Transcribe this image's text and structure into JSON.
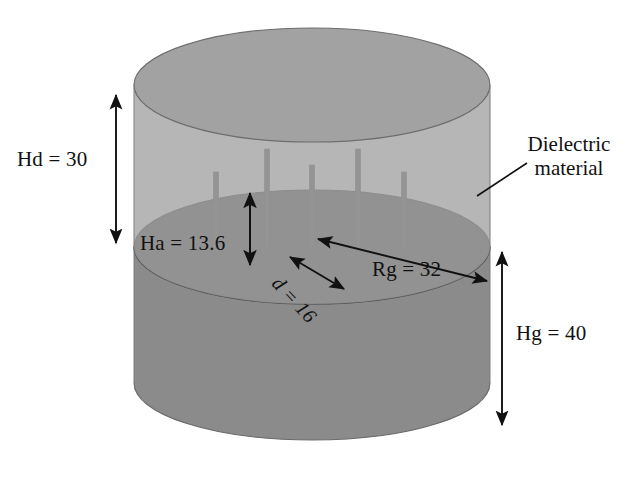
{
  "figure": {
    "background_color": "#ffffff"
  },
  "geometry": {
    "dielectric_cylinder": {
      "fill_color": "#9d9d9d",
      "edge_color": "#6e6e6e",
      "top_ellipse_center_x": 312,
      "top_ellipse_center_y": 85,
      "radius_x": 178,
      "radius_y": 57,
      "top_y": 28,
      "interface_y": 247
    },
    "ground_cylinder": {
      "fill_color": "#8b8b8b",
      "edge_color": "#666666",
      "interface_y": 247,
      "bottom_y": 440
    },
    "ground_plane_ellipse": {
      "fill_color": "#707070",
      "edge_color": "#5a5a5a",
      "center_x": 312,
      "center_y": 247,
      "radius_x": 178,
      "radius_y": 57
    },
    "pins": {
      "count": 5,
      "fill_color": "#7a7a7a",
      "width": 5,
      "items": [
        {
          "x": 216,
          "top_y": 172,
          "bottom_y": 270
        },
        {
          "x": 267,
          "top_y": 149,
          "bottom_y": 288
        },
        {
          "x": 312,
          "top_y": 165,
          "bottom_y": 282
        },
        {
          "x": 358,
          "top_y": 149,
          "bottom_y": 288
        },
        {
          "x": 404,
          "top_y": 172,
          "bottom_y": 270
        }
      ]
    }
  },
  "dimensions": {
    "hd": {
      "label": "Hd = 30",
      "symbol": "Hd",
      "value": 30,
      "arrow_x": 116,
      "arrow_y1": 95,
      "arrow_y2": 243
    },
    "ha": {
      "label": "Ha = 13.6",
      "symbol": "Ha",
      "value": 13.6,
      "arrow_x": 250,
      "arrow_y1": 193,
      "arrow_y2": 265
    },
    "hg": {
      "label": "Hg = 40",
      "symbol": "Hg",
      "value": 40,
      "arrow_x": 502,
      "arrow_y1": 252,
      "arrow_y2": 425
    },
    "rg": {
      "label": "Rg = 32",
      "symbol": "Rg",
      "value": 32,
      "arrow_x1": 318,
      "arrow_y1": 239,
      "arrow_x2": 487,
      "arrow_y2": 281
    },
    "d": {
      "label": "d = 16",
      "symbol": "d",
      "value": 16,
      "arrow_x1": 290,
      "arrow_y1": 257,
      "arrow_x2": 344,
      "arrow_y2": 289
    }
  },
  "annotations": {
    "dielectric": {
      "line1": "Dielectric",
      "line2": "material",
      "leader_x1": 477,
      "leader_y1": 196,
      "leader_x2": 527,
      "leader_y2": 163
    }
  },
  "colors": {
    "ink": "#111111",
    "dielectric_body": "#9d9d9d",
    "ground_body": "#8b8b8b",
    "ground_plane": "#707070",
    "pin": "#7a7a7a",
    "outline": "#6e6e6e"
  }
}
